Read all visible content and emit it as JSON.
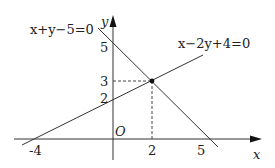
{
  "diagram": {
    "type": "coordinate-plane-lines",
    "axes": {
      "x_label": "x",
      "y_label": "y",
      "origin_label": "O"
    },
    "ticks": {
      "x": [
        "-4",
        "2",
        "5"
      ],
      "y": [
        "2",
        "3",
        "5"
      ]
    },
    "lines": [
      {
        "equation": "x+y−5=0",
        "x_intercept": 5,
        "y_intercept": 5
      },
      {
        "equation": "x−2y+4=0",
        "x_intercept": -4,
        "y_intercept": 2
      }
    ],
    "intersection": {
      "x": 2,
      "y": 3
    },
    "colors": {
      "stroke": "#333333",
      "text": "#222222"
    }
  }
}
